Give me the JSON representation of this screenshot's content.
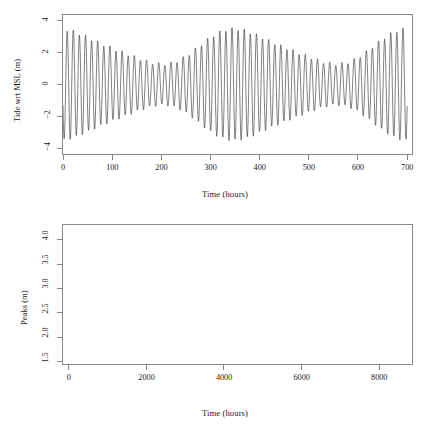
{
  "figure": {
    "kind": "two-panel-r-plot",
    "background": "#ffffff",
    "line_color": "#333333",
    "point_color": "#000000",
    "axis_color": "#8a8a8a"
  },
  "top_panel": {
    "title": "Hypothetical t0 = 10−21−2017 06:52GMT",
    "xlabel": "Time (hours)",
    "ylabel": "Tide wrt MSL (m)",
    "xticks": [
      "0",
      "100",
      "200",
      "300",
      "400",
      "500",
      "600",
      "700"
    ],
    "yticks": [
      "−4",
      "−2",
      "0",
      "2",
      "4"
    ]
  },
  "bottom_panel": {
    "xlabel": "Time (hours)",
    "ylabel": "Peaks (m)",
    "xticks": [
      "0",
      "2000",
      "4000",
      "6000",
      "8000"
    ],
    "yticks": [
      "1.5",
      "2.0",
      "2.5",
      "3.0",
      "3.5",
      "4.0"
    ]
  },
  "chart_data": [
    {
      "id": "tide-timeseries",
      "type": "line",
      "title": "Hypothetical t0 = 10−21−2017 06:52GMT",
      "xlabel": "Time (hours)",
      "ylabel": "Tide wrt MSL (m)",
      "xlim": [
        0,
        710
      ],
      "ylim": [
        -4.35,
        4.35
      ],
      "xticks": [
        0,
        100,
        200,
        300,
        400,
        500,
        600,
        700
      ],
      "yticks": [
        -4,
        -2,
        0,
        2,
        4
      ],
      "grid": false,
      "legend": null,
      "description": "Predicted semi-diurnal tide height relative to mean sea level over ~700 hours, showing spring-neap amplitude modulation.",
      "model": {
        "semidiurnal_period_hours": 12.42,
        "spring_neap_period_hours": 354.4,
        "mean_amplitude_m": 2.35,
        "modulation_amplitude_m": 1.05,
        "modulation_phase_hours": 8,
        "mean_level_m": 0.0,
        "start_value_m": -1.0,
        "samples": 1800
      },
      "envelope_upper": [
        {
          "t": 5,
          "y": 3.9
        },
        {
          "t": 18,
          "y": 3.62
        },
        {
          "t": 31,
          "y": 3.4
        },
        {
          "t": 43,
          "y": 3.12
        },
        {
          "t": 56,
          "y": 2.9
        },
        {
          "t": 68,
          "y": 2.7
        },
        {
          "t": 81,
          "y": 2.5
        },
        {
          "t": 93,
          "y": 2.32
        },
        {
          "t": 106,
          "y": 2.18
        },
        {
          "t": 118,
          "y": 2.08
        },
        {
          "t": 131,
          "y": 2.02
        },
        {
          "t": 143,
          "y": 2.0
        },
        {
          "t": 156,
          "y": 2.03
        },
        {
          "t": 168,
          "y": 2.1
        },
        {
          "t": 181,
          "y": 2.14
        },
        {
          "t": 193,
          "y": 2.18
        },
        {
          "t": 206,
          "y": 2.22
        },
        {
          "t": 218,
          "y": 2.3
        },
        {
          "t": 231,
          "y": 2.4
        },
        {
          "t": 243,
          "y": 2.48
        },
        {
          "t": 256,
          "y": 2.56
        },
        {
          "t": 268,
          "y": 2.62
        },
        {
          "t": 281,
          "y": 2.68
        },
        {
          "t": 293,
          "y": 2.7
        },
        {
          "t": 306,
          "y": 2.66
        },
        {
          "t": 318,
          "y": 2.62
        },
        {
          "t": 331,
          "y": 2.58
        },
        {
          "t": 343,
          "y": 2.54
        },
        {
          "t": 356,
          "y": 2.52
        },
        {
          "t": 368,
          "y": 2.5
        },
        {
          "t": 381,
          "y": 2.52
        },
        {
          "t": 393,
          "y": 2.56
        },
        {
          "t": 406,
          "y": 2.58
        },
        {
          "t": 418,
          "y": 2.6
        },
        {
          "t": 431,
          "y": 2.58
        },
        {
          "t": 443,
          "y": 2.56
        },
        {
          "t": 456,
          "y": 2.54
        },
        {
          "t": 468,
          "y": 2.56
        },
        {
          "t": 481,
          "y": 2.6
        },
        {
          "t": 493,
          "y": 2.66
        },
        {
          "t": 506,
          "y": 2.72
        },
        {
          "t": 518,
          "y": 2.66
        },
        {
          "t": 531,
          "y": 2.6
        },
        {
          "t": 543,
          "y": 2.7
        },
        {
          "t": 556,
          "y": 2.9
        },
        {
          "t": 568,
          "y": 3.1
        },
        {
          "t": 581,
          "y": 3.28
        },
        {
          "t": 593,
          "y": 3.44
        },
        {
          "t": 606,
          "y": 3.6
        },
        {
          "t": 618,
          "y": 3.8
        },
        {
          "t": 631,
          "y": 3.96
        },
        {
          "t": 643,
          "y": 4.0
        },
        {
          "t": 656,
          "y": 4.1
        },
        {
          "t": 668,
          "y": 3.94
        },
        {
          "t": 681,
          "y": 3.78
        },
        {
          "t": 693,
          "y": 3.62
        }
      ],
      "envelope_lower": [
        {
          "t": 11,
          "y": -3.92
        },
        {
          "t": 24,
          "y": -3.66
        },
        {
          "t": 37,
          "y": -3.34
        },
        {
          "t": 49,
          "y": -3.1
        },
        {
          "t": 62,
          "y": -2.88
        },
        {
          "t": 74,
          "y": -2.66
        },
        {
          "t": 87,
          "y": -2.46
        },
        {
          "t": 99,
          "y": -2.3
        },
        {
          "t": 112,
          "y": -2.16
        },
        {
          "t": 124,
          "y": -2.06
        },
        {
          "t": 137,
          "y": -2.0
        },
        {
          "t": 149,
          "y": -1.98
        },
        {
          "t": 162,
          "y": -2.02
        },
        {
          "t": 174,
          "y": -2.08
        },
        {
          "t": 187,
          "y": -2.14
        },
        {
          "t": 199,
          "y": -2.2
        },
        {
          "t": 212,
          "y": -2.28
        },
        {
          "t": 224,
          "y": -2.36
        },
        {
          "t": 237,
          "y": -2.44
        },
        {
          "t": 249,
          "y": -2.52
        },
        {
          "t": 262,
          "y": -2.58
        },
        {
          "t": 274,
          "y": -2.64
        },
        {
          "t": 287,
          "y": -2.66
        },
        {
          "t": 299,
          "y": -2.64
        },
        {
          "t": 312,
          "y": -2.6
        },
        {
          "t": 324,
          "y": -2.56
        },
        {
          "t": 337,
          "y": -2.52
        },
        {
          "t": 349,
          "y": -2.5
        },
        {
          "t": 362,
          "y": -2.5
        },
        {
          "t": 374,
          "y": -2.52
        },
        {
          "t": 387,
          "y": -2.56
        },
        {
          "t": 399,
          "y": -2.58
        },
        {
          "t": 412,
          "y": -2.56
        },
        {
          "t": 424,
          "y": -2.54
        },
        {
          "t": 437,
          "y": -2.52
        },
        {
          "t": 449,
          "y": -2.54
        },
        {
          "t": 462,
          "y": -2.58
        },
        {
          "t": 474,
          "y": -2.62
        },
        {
          "t": 487,
          "y": -2.66
        },
        {
          "t": 499,
          "y": -2.64
        },
        {
          "t": 512,
          "y": -2.58
        },
        {
          "t": 524,
          "y": -2.56
        },
        {
          "t": 537,
          "y": -2.62
        },
        {
          "t": 549,
          "y": -2.8
        },
        {
          "t": 562,
          "y": -3.02
        },
        {
          "t": 574,
          "y": -3.2
        },
        {
          "t": 587,
          "y": -3.38
        },
        {
          "t": 599,
          "y": -3.52
        },
        {
          "t": 612,
          "y": -3.66
        },
        {
          "t": 624,
          "y": -3.8
        },
        {
          "t": 637,
          "y": -3.88
        },
        {
          "t": 649,
          "y": -3.94
        },
        {
          "t": 662,
          "y": -3.86
        },
        {
          "t": 674,
          "y": -3.76
        },
        {
          "t": 687,
          "y": -3.62
        },
        {
          "t": 699,
          "y": -1.5
        }
      ]
    },
    {
      "id": "peaks-scatter",
      "type": "scatter",
      "title": "",
      "xlabel": "Time (hours)",
      "ylabel": "Peaks (m)",
      "xlim": [
        -150,
        8850
      ],
      "ylim": [
        1.45,
        4.3
      ],
      "xticks": [
        0,
        2000,
        4000,
        6000,
        8000
      ],
      "yticks": [
        1.5,
        2.0,
        2.5,
        3.0,
        3.5,
        4.0
      ],
      "grid": false,
      "legend": null,
      "marker": "square",
      "marker_size_px": 2.6,
      "description": "Absolute heights of successive tidal peaks (high and low water extremes) over one year, showing ~25 spring-neap cycles with modulated envelope.",
      "model": {
        "peak_interval_hours": 6.21,
        "spring_neap_period_hours": 354.4,
        "base_m": 2.55,
        "cycle_amplitude_m": 0.6,
        "long_period_hours": 2400,
        "long_amplitude_m": 0.42,
        "scatter_m": 0.1,
        "n_points": 1400
      },
      "cycle_peaks": [
        {
          "t": 40,
          "ymax": 3.9,
          "ymin": 2.25
        },
        {
          "t": 210,
          "ymax": 2.62,
          "ymin": 1.92
        },
        {
          "t": 640,
          "ymax": 4.12,
          "ymin": 2.3
        },
        {
          "t": 900,
          "ymax": 2.72,
          "ymin": 1.8
        },
        {
          "t": 1300,
          "ymax": 3.82,
          "ymin": 2.0
        },
        {
          "t": 1580,
          "ymax": 2.62,
          "ymin": 1.66
        },
        {
          "t": 1980,
          "ymax": 3.4,
          "ymin": 2.02
        },
        {
          "t": 2260,
          "ymax": 2.58,
          "ymin": 1.6
        },
        {
          "t": 2520,
          "ymax": 3.34,
          "ymin": 2.0
        },
        {
          "t": 2950,
          "ymax": 2.9,
          "ymin": 1.68
        },
        {
          "t": 3180,
          "ymax": 3.58,
          "ymin": 2.1
        },
        {
          "t": 3480,
          "ymax": 2.76,
          "ymin": 1.84
        },
        {
          "t": 3900,
          "ymax": 4.1,
          "ymin": 2.26
        },
        {
          "t": 4180,
          "ymax": 2.72,
          "ymin": 2.0
        },
        {
          "t": 4520,
          "ymax": 4.22,
          "ymin": 2.32
        },
        {
          "t": 4820,
          "ymax": 2.7,
          "ymin": 2.18
        },
        {
          "t": 5180,
          "ymax": 4.08,
          "ymin": 2.28
        },
        {
          "t": 5480,
          "ymax": 2.6,
          "ymin": 1.84
        },
        {
          "t": 5880,
          "ymax": 3.86,
          "ymin": 2.1
        },
        {
          "t": 6160,
          "ymax": 2.7,
          "ymin": 1.78
        },
        {
          "t": 6580,
          "ymax": 3.54,
          "ymin": 2.06
        },
        {
          "t": 6880,
          "ymax": 2.62,
          "ymin": 1.64
        },
        {
          "t": 7140,
          "ymax": 3.34,
          "ymin": 2.02
        },
        {
          "t": 7580,
          "ymax": 2.74,
          "ymin": 1.62
        },
        {
          "t": 7840,
          "ymax": 3.66,
          "ymin": 2.06
        },
        {
          "t": 8160,
          "ymax": 2.96,
          "ymin": 1.72
        },
        {
          "t": 8440,
          "ymax": 4.06,
          "ymin": 2.3
        },
        {
          "t": 8680,
          "ymax": 2.74,
          "ymin": 2.4
        }
      ]
    }
  ]
}
